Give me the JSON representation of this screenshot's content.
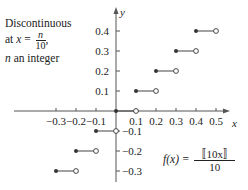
{
  "chart_data": {
    "type": "step",
    "title": "",
    "function": "f(x) = [[10x]] / 10",
    "xlabel": "x",
    "ylabel": "y",
    "xlim": [
      -0.35,
      0.55
    ],
    "ylim": [
      -0.35,
      0.45
    ],
    "x_ticks": [
      -0.3,
      -0.2,
      -0.1,
      0.1,
      0.2,
      0.3,
      0.4,
      0.5
    ],
    "y_ticks": [
      -0.3,
      -0.2,
      -0.1,
      0.1,
      0.2,
      0.3,
      0.4
    ],
    "x_tick_labels": [
      "−0.3",
      "−0.2",
      "−0.1",
      "0.1",
      "0.2",
      "0.3",
      "0.4",
      "0.5"
    ],
    "y_tick_labels": [
      "−0.3",
      "−0.2",
      "−0.1",
      "0.1",
      "0.2",
      "0.3",
      "0.4"
    ],
    "segments": [
      {
        "x_start": -0.3,
        "x_end": -0.2,
        "y": -0.3,
        "start": "closed",
        "end": "open"
      },
      {
        "x_start": -0.2,
        "x_end": -0.1,
        "y": -0.2,
        "start": "closed",
        "end": "open"
      },
      {
        "x_start": -0.1,
        "x_end": 0.0,
        "y": -0.1,
        "start": "closed",
        "end": "open"
      },
      {
        "x_start": 0.0,
        "x_end": 0.1,
        "y": 0.0,
        "start": "closed",
        "end": "open"
      },
      {
        "x_start": 0.1,
        "x_end": 0.2,
        "y": 0.1,
        "start": "closed",
        "end": "open"
      },
      {
        "x_start": 0.2,
        "x_end": 0.3,
        "y": 0.2,
        "start": "closed",
        "end": "open"
      },
      {
        "x_start": 0.3,
        "x_end": 0.4,
        "y": 0.3,
        "start": "closed",
        "end": "open"
      },
      {
        "x_start": 0.4,
        "x_end": 0.5,
        "y": 0.4,
        "start": "closed",
        "end": "open"
      }
    ],
    "annotations": [
      "Discontinuous at x = n/10, n an integer",
      "f(x) = [[10x]]/10"
    ],
    "grid": false,
    "legend": null
  },
  "annotation": {
    "line1": "Discontinuous",
    "line2_prefix": "at ",
    "line2_var": "x",
    "line2_eq": " = ",
    "frac_num": "n",
    "frac_den": "10",
    "line2_suffix": ",",
    "line3_var": "n",
    "line3_rest": " an integer"
  },
  "formula": {
    "lhs": "f(x) = ",
    "num": "〚10x〛",
    "den": "10"
  },
  "axes": {
    "x_label": "x",
    "y_label": "y"
  },
  "style": {
    "axis_color": "#555555",
    "segment_color": "#444444",
    "dot_color": "#333333"
  }
}
